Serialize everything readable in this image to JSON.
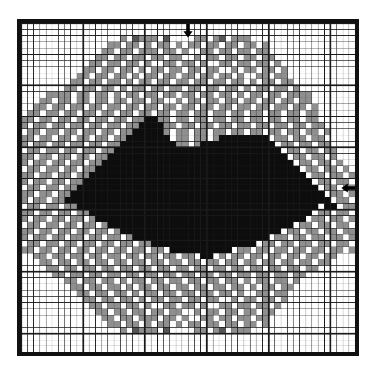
{
  "chart_data": {
    "type": "heatmap",
    "title": "",
    "subtitle": "",
    "xlabel": "",
    "ylabel": "",
    "grid": true,
    "legend_position": "none",
    "columns": 54,
    "rows": 53,
    "cell_px": 6.25,
    "heavy_line_every": 10,
    "axis_ranges": {
      "x": [
        1,
        54
      ],
      "y": [
        1,
        53
      ]
    },
    "palette": {
      "0": {
        "name": "white / unworked ground",
        "hex": "#ffffff"
      },
      "1": {
        "name": "light grey",
        "hex": "#8f8f8f"
      },
      "2": {
        "name": "dark grey",
        "hex": "#555555"
      },
      "3": {
        "name": "black",
        "hex": "#0d0d0d"
      }
    },
    "legend_entries": [
      {
        "symbol": "0",
        "color": "#ffffff",
        "label": "white"
      },
      {
        "symbol": "1",
        "color": "#8f8f8f",
        "label": "light grey"
      },
      {
        "symbol": "2",
        "color": "#555555",
        "label": "dark grey"
      },
      {
        "symbol": "3",
        "color": "#0d0d0d",
        "label": "black"
      }
    ],
    "center_markers": [
      {
        "name": "top-center-marker",
        "edge": "top",
        "glyph": "down-arrow",
        "column": 27
      },
      {
        "name": "right-center-marker",
        "edge": "right",
        "glyph": "left-arrow",
        "row": 27
      }
    ],
    "grid_line_color": "#1a1a1a",
    "frame_color": "#111111",
    "background": "#ffffff",
    "cells": [
      "000000000000000000000000000000000000000000000000000000",
      "000000000000000000000000000000000000000000000000000000",
      "000000000000000010211102000011012011100000000000000000",
      "000000000000001101101011010110110110110100000000000000",
      "000000000000011011011101101001101101101100000000000000",
      "000000000000110110110110110010110110110110000000000000",
      "000000000001101101101001101101001101101101000000000000",
      "000000000011011011010110110110110010110110100000000000",
      "000000000110110110101101101101101101001101100000000000",
      "000000001101101101011011011011011011010110110000000000",
      "000000011011011010110110110110110110101101101000000000",
      "000011110110110101101101101101101101011011011110000000",
      "000110110110110110110110010110110110110110110110000000",
      "001101101101101101101101101101101101101101101101000000",
      "011011011011011011011011011011011011011011011011000000",
      "110110110110110110113311011011011011011011011011000000",
      "101101101101101101133331101101101101101101101101100000",
      "011011011011011011333331011011011011011011011011010000",
      "110110110110110113333333011011013333333301101101100000",
      "101101101101101133333333311013333333333330110110110000",
      "011011011011011333333333333333333333333333011011011000",
      "110110110110113333333333333333333333333333301101101000",
      "101101101101133333333333333333333333333333330110110100",
      "011011011011333333333333333333333333333333333011011010",
      "110110110113333333333333333333333333333333333301101101",
      "101101101133333333333333333333333333333333333330110110",
      "011011011333333333333333333333333333333333333333011011",
      "110110113333333333333333333333333333333333333333301101",
      "101101133333333333333333333333333333333333333333330110",
      "011011011333333333333333333333333333333333333333033011",
      "110110110113333333333333333333333333333333333330110110",
      "101101101101333333333333333333333333333333333301101101",
      "011011011011013333333333333333333333333333330110110110",
      "110110110110110133333333333333333333333333011011011011",
      "101101101101101101333333333333333333333301101101101101",
      "011011011011011011011333333333333333330110110110110110",
      "110110110110110110110110333333333301101101101101101101",
      "001101101101101101101101101103301011011011011011011000",
      "000110110110110110110110110110110110110110110110110000",
      "000011011011011011011011011011011011011011011011000000",
      "000001101101101101101101101101101101101101101100000000",
      "000000011011011010110110110110110110101101101000000000",
      "000000001101101101011011011011011011010110110000000000",
      "000000000110110110101101101101101101001101100000000000",
      "000000000011011011010110110110110010110110100000000000",
      "000000000001101101101001101101001101101101000000000000",
      "000000000000110110110110110010110110110110000000000000",
      "000000000000011011011101101001101101101100000000000000",
      "000000000000001101101011010110110110110100000000000000",
      "000000000000000010211102000011012011100000000000000000",
      "000000000000000000000000000000000000000000000000000000",
      "000000000000000000000000000000000000000000000000000000",
      "000000000000000000000000000000000000000000000000000000"
    ]
  },
  "markers": {
    "top_arrow_glyph": "▼",
    "right_arrow_glyph": "◀"
  }
}
